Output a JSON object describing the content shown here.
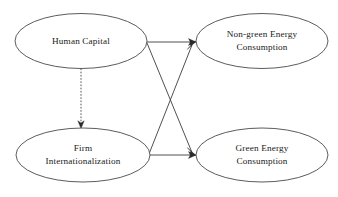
{
  "diagram": {
    "type": "path-diagram",
    "background_color": "#ffffff",
    "stroke_color": "#3c3c3c",
    "text_color": "#1a1a1a",
    "nodes": [
      {
        "id": "human-capital",
        "label_lines": [
          "Human Capital"
        ],
        "line1": "Human Capital",
        "line2": "",
        "cx": 81,
        "cy": 41,
        "rx": 66,
        "ry": 27.5
      },
      {
        "id": "non-green-energy-consumption",
        "label_lines": [
          "Non-green Energy",
          "Consumption"
        ],
        "line1": "Non-green Energy",
        "line2": "Consumption",
        "cx": 262,
        "cy": 41,
        "rx": 66,
        "ry": 27.5
      },
      {
        "id": "firm-internationalization",
        "label_lines": [
          "Firm",
          "Internationalization"
        ],
        "line1": "Firm",
        "line2": "Internationalization",
        "cx": 83,
        "cy": 155,
        "rx": 67,
        "ry": 27
      },
      {
        "id": "green-energy-consumption",
        "label_lines": [
          "Green Energy",
          "Consumption"
        ],
        "line1": "Green Energy",
        "line2": "Consumption",
        "cx": 262,
        "cy": 155,
        "rx": 66,
        "ry": 27
      }
    ],
    "edges": [
      {
        "id": "hc-to-nonGreen",
        "from": "human-capital",
        "to": "non-green-energy-consumption",
        "style": "solid",
        "arrow": "end"
      },
      {
        "id": "hc-to-green",
        "from": "human-capital",
        "to": "green-energy-consumption",
        "style": "solid",
        "arrow": "end"
      },
      {
        "id": "firm-to-nonGreen",
        "from": "firm-internationalization",
        "to": "non-green-energy-consumption",
        "style": "solid",
        "arrow": "end"
      },
      {
        "id": "firm-to-green",
        "from": "firm-internationalization",
        "to": "green-energy-consumption",
        "style": "solid",
        "arrow": "end"
      },
      {
        "id": "hc-to-firm",
        "from": "human-capital",
        "to": "firm-internationalization",
        "style": "dashed",
        "arrow": "end"
      }
    ]
  }
}
